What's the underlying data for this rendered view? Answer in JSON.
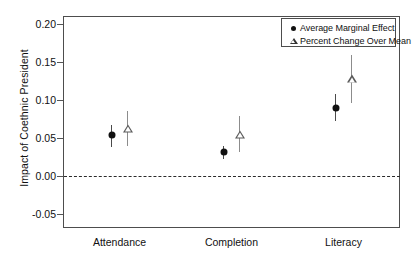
{
  "chart_data": {
    "type": "scatter",
    "title": "",
    "subtitle": "",
    "xlabel": "",
    "ylabel": "Impact of Coethnic President",
    "categories": [
      "Attendance",
      "Completion",
      "Literacy"
    ],
    "ylim": [
      -0.05,
      0.2
    ],
    "yticks": [
      0.2,
      0.15,
      0.1,
      0.05,
      0.0,
      -0.05
    ],
    "ytick_labels": [
      "0.20",
      "0.15",
      "0.10",
      "0.05",
      "0.00",
      "-0.05"
    ],
    "grid": false,
    "legend_position": "top-right",
    "reference_line": {
      "value": 0.0,
      "style": "dashed"
    },
    "series": [
      {
        "name": "Average Marginal Effect",
        "marker": "filled-circle",
        "values": [
          0.054,
          0.031,
          0.09
        ],
        "ci_low": [
          0.038,
          0.022,
          0.072
        ],
        "ci_high": [
          0.067,
          0.039,
          0.108
        ]
      },
      {
        "name": "Percent Change Over Mean",
        "marker": "open-triangle",
        "values": [
          0.062,
          0.054,
          0.127
        ],
        "ci_low": [
          0.04,
          0.031,
          0.096
        ],
        "ci_high": [
          0.085,
          0.079,
          0.159
        ]
      }
    ],
    "legend_entries": [
      {
        "label": "Average Marginal Effect",
        "marker": "filled-circle"
      },
      {
        "label": "Percent Change Over Mean",
        "marker": "open-triangle"
      }
    ]
  }
}
